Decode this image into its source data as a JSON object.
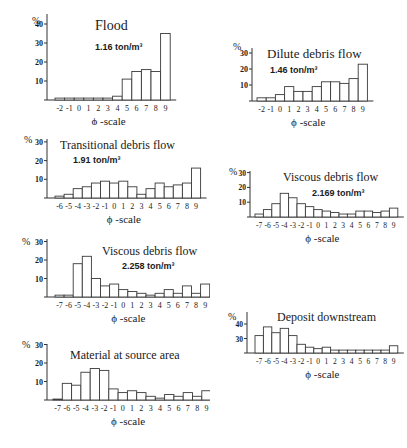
{
  "figure": {
    "xlabel": "ϕ -scale",
    "y_unit": "%"
  },
  "chart_data": [
    {
      "id": "flood",
      "type": "bar",
      "title": "Flood",
      "subtitle": "1.16 ton/m³",
      "xlabel": "ϕ -scale",
      "ylabel": "%",
      "categories": [
        "-2",
        "-1",
        "0",
        "1",
        "2",
        "3",
        "4",
        "5",
        "6",
        "7",
        "8",
        "9"
      ],
      "values": [
        1,
        1,
        1,
        1,
        1,
        1,
        2,
        11,
        15,
        16,
        15,
        35
      ],
      "yticks": [
        10,
        20,
        30,
        40
      ],
      "ylim": [
        0,
        40
      ]
    },
    {
      "id": "dilute",
      "type": "bar",
      "title": "Dilute debris flow",
      "subtitle": "1.46 ton/m³",
      "xlabel": "ϕ -scale",
      "ylabel": "%",
      "categories": [
        "-2",
        "-1",
        "0",
        "1",
        "2",
        "3",
        "4",
        "5",
        "6",
        "7",
        "8",
        "9"
      ],
      "values": [
        2,
        2,
        4,
        9,
        6,
        6,
        9,
        12,
        12,
        11,
        14,
        23
      ],
      "yticks": [
        10,
        20,
        30
      ],
      "ylim": [
        0,
        30
      ]
    },
    {
      "id": "transitional",
      "type": "bar",
      "title": "Transitional debris flow",
      "subtitle": "1.91 ton/m³",
      "xlabel": "ϕ -scale",
      "ylabel": "%",
      "categories": [
        "-6",
        "-5",
        "-4",
        "-3",
        "-2",
        "-1",
        "0",
        "1",
        "2",
        "3",
        "4",
        "5",
        "6",
        "7",
        "8",
        "9"
      ],
      "values": [
        1,
        2,
        5,
        6,
        8,
        9,
        8,
        9,
        6,
        2,
        5,
        8,
        6,
        7,
        8,
        16
      ],
      "yticks": [
        10,
        20,
        30
      ],
      "ylim": [
        0,
        30
      ]
    },
    {
      "id": "viscous2169",
      "type": "bar",
      "title": "Viscous debris flow",
      "subtitle": "2.169 ton/m³",
      "xlabel": "ϕ -scale",
      "ylabel": "%",
      "categories": [
        "-7",
        "-6",
        "-5",
        "-4",
        "-3",
        "-2",
        "-1",
        "0",
        "1",
        "2",
        "3",
        "4",
        "5",
        "6",
        "7",
        "8",
        "9"
      ],
      "values": [
        2,
        5,
        9,
        16,
        13,
        9,
        7,
        5,
        4,
        3,
        2,
        2,
        4,
        4,
        3,
        4,
        6
      ],
      "yticks": [
        10,
        20,
        30
      ],
      "ylim": [
        0,
        30
      ]
    },
    {
      "id": "viscous2258",
      "type": "bar",
      "title": "Viscous debris flow",
      "subtitle": "2.258 ton/m³",
      "xlabel": "ϕ -scale",
      "ylabel": "%",
      "categories": [
        "-7",
        "-6",
        "-5",
        "-4",
        "-3",
        "-2",
        "-1",
        "0",
        "1",
        "2",
        "3",
        "4",
        "5",
        "6",
        "7",
        "8",
        "9"
      ],
      "values": [
        1,
        1,
        18,
        22,
        10,
        6,
        7,
        4,
        3,
        2,
        1,
        2,
        4,
        2,
        6,
        2,
        7
      ],
      "yticks": [
        10,
        20,
        30
      ],
      "ylim": [
        0,
        30
      ]
    },
    {
      "id": "deposit",
      "type": "bar",
      "title": "Deposit downstream",
      "subtitle": "",
      "xlabel": "ϕ -scale",
      "ylabel": "%",
      "categories": [
        "-7",
        "-6",
        "-5",
        "-4",
        "-3",
        "-2",
        "-1",
        "0",
        "1",
        "2",
        "3",
        "4",
        "5",
        "6",
        "7",
        "8",
        "9"
      ],
      "values": [
        32,
        38,
        34,
        37,
        32,
        26,
        24,
        23,
        24,
        22,
        22,
        22,
        22,
        22,
        22,
        22,
        25
      ],
      "yticks": [
        30,
        40
      ],
      "ylim": [
        20,
        40
      ]
    },
    {
      "id": "source",
      "type": "bar",
      "title": "Material at source area",
      "subtitle": "",
      "xlabel": "ϕ -scale",
      "ylabel": "%",
      "categories": [
        "-7",
        "-6",
        "-5",
        "-4",
        "-3",
        "-2",
        "-1",
        "0",
        "1",
        "2",
        "3",
        "4",
        "5",
        "6",
        "7",
        "8",
        "9"
      ],
      "values": [
        0.5,
        9,
        8,
        15,
        17,
        16,
        6,
        4,
        5,
        4,
        2,
        1,
        3,
        2,
        4,
        2,
        5
      ],
      "yticks": [
        10,
        20,
        30
      ],
      "ylim": [
        0,
        30
      ]
    }
  ]
}
